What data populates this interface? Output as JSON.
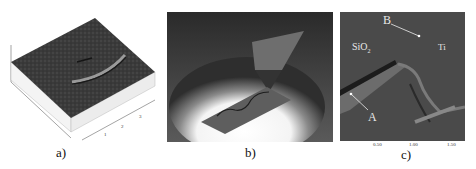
{
  "figure": {
    "panels": [
      {
        "id": "a",
        "caption": "a)",
        "description": "3D AFM topography of a surface with a curved ridge"
      },
      {
        "id": "b",
        "caption": "b)",
        "description": "Rendered illustration of AFM tip over a substrate with a wavy line under a spotlight"
      },
      {
        "id": "c",
        "caption": "c)",
        "description": "AFM image with labeled regions",
        "labels": {
          "top_right_point": "B",
          "material_left": "SiO",
          "material_left_sub": "2",
          "material_right": "Ti",
          "bottom_left_point": "A"
        },
        "x_ticks": [
          "0.50",
          "1.00",
          "1.50"
        ]
      }
    ],
    "panel_a_ticks": [
      "1",
      "2",
      "3"
    ]
  }
}
